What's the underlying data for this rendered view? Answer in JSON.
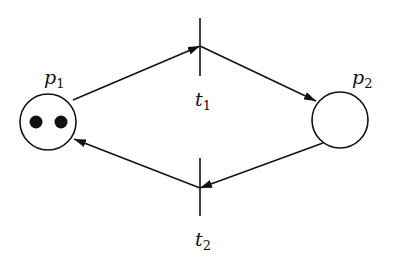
{
  "diagram": {
    "type": "petri-net",
    "places": [
      {
        "id": "p1",
        "label": "p",
        "subscript": "1",
        "tokens": 2
      },
      {
        "id": "p2",
        "label": "p",
        "subscript": "2",
        "tokens": 0
      }
    ],
    "transitions": [
      {
        "id": "t1",
        "label": "t",
        "subscript": "1"
      },
      {
        "id": "t2",
        "label": "t",
        "subscript": "2"
      }
    ],
    "arcs": [
      {
        "from": "p1",
        "to": "t1"
      },
      {
        "from": "t1",
        "to": "p2"
      },
      {
        "from": "p2",
        "to": "t2"
      },
      {
        "from": "t2",
        "to": "p1"
      }
    ],
    "colors": {
      "stroke": "#111111",
      "background": "#ffffff"
    }
  }
}
